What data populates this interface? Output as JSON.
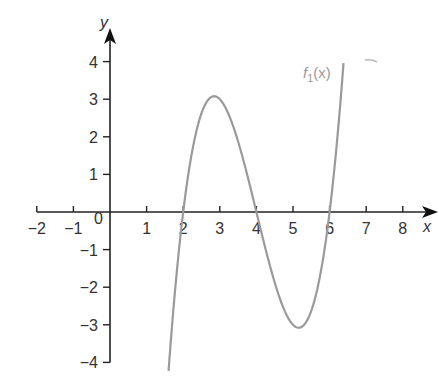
{
  "chart_data": {
    "type": "line",
    "title": "",
    "xlabel": "x",
    "ylabel": "y",
    "xlim": [
      -2,
      8.5
    ],
    "ylim": [
      -4,
      4.8
    ],
    "x_ticks": [
      -2,
      -1,
      1,
      2,
      3,
      4,
      5,
      6,
      7,
      8
    ],
    "x_tick_labels": [
      "−2",
      "−1",
      "1",
      "2",
      "3",
      "4",
      "5",
      "6",
      "7",
      "8"
    ],
    "y_ticks": [
      4,
      3,
      2,
      1,
      -1,
      -2,
      -3,
      -4
    ],
    "y_tick_labels": [
      "4",
      "3",
      "2",
      "1",
      "−1",
      "−2",
      "−3",
      "−4"
    ],
    "origin_label": "0",
    "grid": false,
    "series": [
      {
        "name": "f1(x)",
        "label_main": "f",
        "label_sub": "1",
        "label_rest": "(x)",
        "expression": "(x-2)(x-4)(x-6)",
        "color": "#9a9a9a",
        "x_range": [
          1.6,
          6.38
        ],
        "roots": [
          2,
          4,
          6
        ],
        "local_max": [
          2.85,
          3.08
        ],
        "local_min": [
          5.15,
          -3.08
        ]
      }
    ]
  }
}
